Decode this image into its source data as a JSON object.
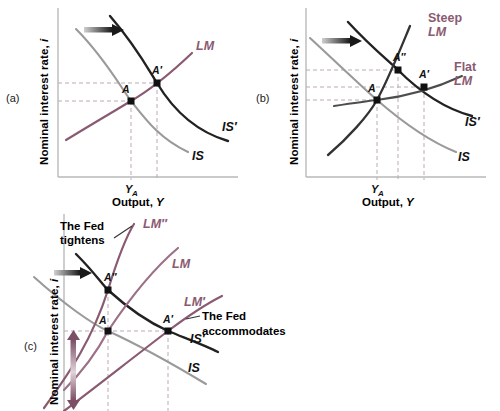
{
  "figure": {
    "panels": [
      {
        "tag": "(a)",
        "axis": {
          "ylabel_main": "Nominal interest rate,",
          "ylabel_var": "i",
          "xlabel_main": "Output,",
          "xlabel_var": "Y"
        },
        "ticks": [
          {
            "label": "Y",
            "sub": "A"
          }
        ],
        "curves": [
          {
            "name": "LM",
            "label": "LM",
            "color": "#8a5a72",
            "style": "upward-sloping"
          },
          {
            "name": "IS",
            "label": "IS",
            "color": "#9a9a9a",
            "style": "downward-sloping"
          },
          {
            "name": "IS-prime",
            "label": "IS′",
            "color": "#222222",
            "style": "downward-sloping"
          }
        ],
        "points": [
          {
            "label": "A"
          },
          {
            "label": "A′"
          }
        ],
        "arrows": [
          {
            "name": "shift-right-arrow",
            "direction": "right"
          }
        ]
      },
      {
        "tag": "(b)",
        "axis": {
          "ylabel_main": "Nominal interest rate,",
          "ylabel_var": "i",
          "xlabel_main": "Output,",
          "xlabel_var": "Y"
        },
        "ticks": [
          {
            "label": "Y",
            "sub": "A"
          }
        ],
        "curves": [
          {
            "name": "steep-LM",
            "label_line1": "Steep",
            "label_line2": "LM",
            "color": "#8a5a72",
            "style": "steep-upward"
          },
          {
            "name": "flat-LM",
            "label_line1": "Flat",
            "label_line2": "LM",
            "color": "#8a5a72",
            "style": "flat-upward"
          },
          {
            "name": "IS",
            "label": "IS",
            "color": "#9a9a9a",
            "style": "downward-sloping"
          },
          {
            "name": "IS-prime",
            "label": "IS′",
            "color": "#222222",
            "style": "downward-sloping"
          }
        ],
        "points": [
          {
            "label": "A"
          },
          {
            "label": "A′"
          },
          {
            "label": "A″"
          }
        ],
        "arrows": [
          {
            "name": "shift-right-arrow",
            "direction": "right"
          }
        ]
      },
      {
        "tag": "(c)",
        "axis": {
          "ylabel_main": "Nominal interest rate,",
          "ylabel_var": "i"
        },
        "curves": [
          {
            "name": "LM-double-prime",
            "label": "LM″",
            "color": "#8a5a72",
            "style": "upward-sloping"
          },
          {
            "name": "LM",
            "label": "LM",
            "color": "#8a5a72",
            "style": "upward-sloping"
          },
          {
            "name": "LM-prime",
            "label": "LM′",
            "color": "#8a5a72",
            "style": "upward-sloping"
          },
          {
            "name": "IS",
            "label": "IS",
            "color": "#9a9a9a",
            "style": "downward-sloping"
          },
          {
            "name": "IS-prime",
            "label": "IS′",
            "color": "#222222",
            "style": "downward-sloping"
          }
        ],
        "points": [
          {
            "label": "A"
          },
          {
            "label": "A′"
          },
          {
            "label": "A″"
          }
        ],
        "annotations": [
          {
            "name": "fed-tightens-note",
            "line1": "The Fed",
            "line2": "tightens"
          },
          {
            "name": "fed-accommodates-note",
            "line1": "The Fed",
            "line2": "accommodates"
          }
        ],
        "arrows": [
          {
            "name": "shift-right-arrow",
            "direction": "right"
          },
          {
            "name": "rate-up-arrow",
            "direction": "up"
          },
          {
            "name": "rate-down-arrow",
            "direction": "down"
          }
        ]
      }
    ],
    "colors": {
      "lm_purple": "#8a5a72",
      "is_gray": "#9a9a9a",
      "is_prime_dark": "#222222",
      "axis": "#b9b9b9",
      "dashed": "#b9aab2"
    }
  }
}
